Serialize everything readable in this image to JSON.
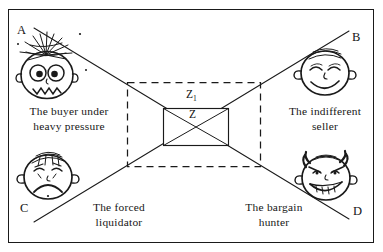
{
  "figure": {
    "type": "diagram",
    "background_color": "#ffffff",
    "ink_color": "#1a1a1a",
    "corner_labels": [
      {
        "id": "A",
        "text": "A",
        "position": "top-left"
      },
      {
        "id": "B",
        "text": "B",
        "position": "top-right"
      },
      {
        "id": "C",
        "text": "C",
        "position": "bottom-left"
      },
      {
        "id": "D",
        "text": "D",
        "position": "bottom-right"
      }
    ],
    "zone_labels": [
      {
        "id": "z1",
        "text": "Z",
        "subscript": "1",
        "note": "label of the outer dashed rectangle"
      },
      {
        "id": "z",
        "text": "Z",
        "subscript": "",
        "note": "label of the inner solid rectangle"
      }
    ],
    "captions": [
      {
        "id": "buyer",
        "line1": "The buyer under",
        "line2": "heavy pressure",
        "corner": "A"
      },
      {
        "id": "seller",
        "line1": "The indifferent",
        "line2": "seller",
        "corner": "B"
      },
      {
        "id": "liquidator",
        "line1": "The forced",
        "line2": "liquidator",
        "corner": "C"
      },
      {
        "id": "hunter",
        "line1": "The bargain",
        "line2": "hunter",
        "corner": "D"
      }
    ],
    "faces": [
      {
        "id": "buyer-face",
        "expression": "anxious, bulging eyes, spiky hair, jagged mouth"
      },
      {
        "id": "seller-face",
        "expression": "relaxed, closed eyes, smiling, bald with large ears"
      },
      {
        "id": "liquidator-face",
        "expression": "sad, frowning mouth, squeezed eyes"
      },
      {
        "id": "hunter-face",
        "expression": "sly toothy grin, arched eyebrows, hair tufts"
      }
    ],
    "shapes": {
      "outer_rect": {
        "style": "dashed",
        "label": "Z1"
      },
      "inner_rect": {
        "style": "solid",
        "label": "Z"
      },
      "diagonals": [
        {
          "from": "A",
          "to": "D",
          "style": "solid"
        },
        {
          "from": "C",
          "to": "B",
          "style": "solid"
        }
      ],
      "border": {
        "style": "solid"
      }
    }
  }
}
